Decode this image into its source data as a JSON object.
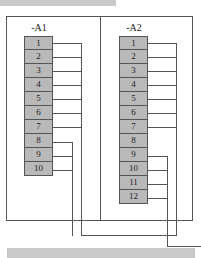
{
  "diagram": {
    "type": "terminal-strip-wiring",
    "colors": {
      "terminal_fill": "#b9b9b9",
      "line": "#555555",
      "bar": "#c9c9c9"
    },
    "panels": [
      {
        "label": "-A1",
        "terminals": [
          "1",
          "2",
          "3",
          "4",
          "5",
          "6",
          "7",
          "8",
          "9",
          "10"
        ],
        "groups": [
          {
            "terminals": [
              "1",
              "2",
              "3",
              "4",
              "5",
              "6",
              "7"
            ],
            "bus": "A1-bus-1"
          },
          {
            "terminals": [
              "8",
              "9",
              "10"
            ],
            "bus": "A1-bus-2"
          }
        ]
      },
      {
        "label": "-A2",
        "terminals": [
          "1",
          "2",
          "3",
          "4",
          "5",
          "6",
          "7",
          "8",
          "9",
          "10",
          "11",
          "12"
        ],
        "groups": [
          {
            "terminals": [
              "1",
              "2",
              "3",
              "4",
              "5",
              "6",
              "7"
            ],
            "bus": "A2-bus-1"
          },
          {
            "terminals": [
              "9",
              "10",
              "11",
              "12"
            ],
            "bus": "A2-bus-2"
          }
        ]
      }
    ]
  }
}
